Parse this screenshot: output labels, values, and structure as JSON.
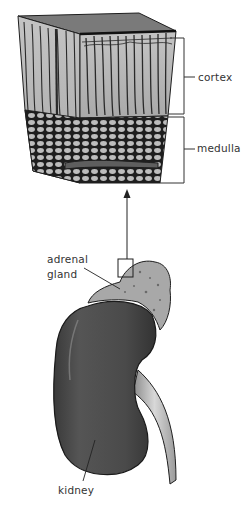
{
  "figure": {
    "type": "anatomical illustration",
    "labels": {
      "cortex": "cortex",
      "medulla": "medulla",
      "adrenal_line1": "adrenal",
      "adrenal_line2": "gland",
      "kidney": "kidney"
    },
    "colors": {
      "ink": "#1e1e1e",
      "kidney_fill": "#4a4a4a",
      "gland_fill": "#a8a8a8",
      "cortex_fill": "#b9b9b9",
      "medulla_fill": "#8c8c8c",
      "ureter_fill": "#c8c8c8",
      "label_text": "#333333"
    }
  }
}
